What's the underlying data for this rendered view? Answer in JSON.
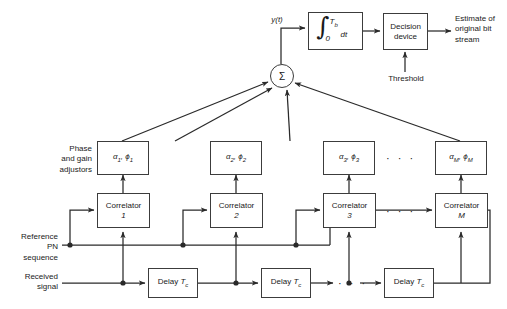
{
  "figure": {
    "stroke_color": "#3c3c3c",
    "text_color": "#1a1a1a",
    "background": "#ffffff"
  },
  "labels": {
    "y_signal": "y(t)",
    "threshold": "Threshold",
    "estimate": "Estimate of\noriginal bit\nstream",
    "phase_gain": "Phase\nand gain\nadjustors",
    "reference_pn": "Reference\nPN\nsequence",
    "received_signal": "Received\nsignal",
    "ellipsis": "· · ·"
  },
  "blocks": {
    "integrator": {
      "integral_sign": "∫",
      "upper_limit": "T",
      "upper_limit_sub": "b",
      "lower_limit": "0",
      "differential": "dt"
    },
    "decision_device": "Decision\ndevice",
    "adjustors": [
      {
        "alpha": "α",
        "alpha_sub": "1",
        "phi": "ϕ",
        "phi_sub": "1"
      },
      {
        "alpha": "α",
        "alpha_sub": "2",
        "phi": "ϕ",
        "phi_sub": "2"
      },
      {
        "alpha": "α",
        "alpha_sub": "3",
        "phi": "ϕ",
        "phi_sub": "3"
      },
      {
        "alpha": "α",
        "alpha_sub": "M",
        "phi": "ϕ",
        "phi_sub": "M"
      }
    ],
    "correlators": [
      {
        "name": "Correlator",
        "index": "1"
      },
      {
        "name": "Correlator",
        "index": "2"
      },
      {
        "name": "Correlator",
        "index": "3"
      },
      {
        "name": "Correlator",
        "index": "M"
      }
    ],
    "delays": [
      {
        "name": "Delay",
        "symbol": "T",
        "symbol_sub": "c"
      },
      {
        "name": "Delay",
        "symbol": "T",
        "symbol_sub": "c"
      },
      {
        "name": "Delay",
        "symbol": "T",
        "symbol_sub": "c"
      }
    ],
    "summer": {
      "symbol": "Σ"
    }
  }
}
